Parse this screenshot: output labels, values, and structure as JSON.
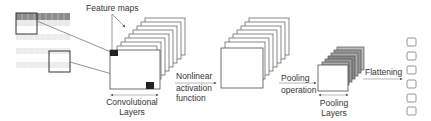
{
  "diagram": {
    "type": "cnn-pipeline",
    "labels": {
      "feature_maps": "Feature maps",
      "conv_layers_line1": "Convolutional",
      "conv_layers_line2": "Layers",
      "nonlinear_line1": "Nonlinear",
      "nonlinear_line2": "activation",
      "nonlinear_line3": "function",
      "pooling_op_line1": "Pooling",
      "pooling_op_line2": "operation",
      "pooling_layers_line1": "Pooling",
      "pooling_layers_line2": "Layers",
      "flattening": "Flattening"
    },
    "stages": [
      {
        "name": "input-image",
        "rows": 5
      },
      {
        "name": "convolutional-layers",
        "maps": 8
      },
      {
        "name": "activation-maps",
        "maps": 8
      },
      {
        "name": "pooling-layers",
        "maps": 6
      },
      {
        "name": "flattened-output",
        "nodes": 6
      }
    ],
    "colors": {
      "stroke": "#333333",
      "stack_stroke": "#555555",
      "kernel_fill": "#222222",
      "input_dark_row": "#8c8c8c",
      "input_light_row": "#e6e6e6"
    }
  }
}
